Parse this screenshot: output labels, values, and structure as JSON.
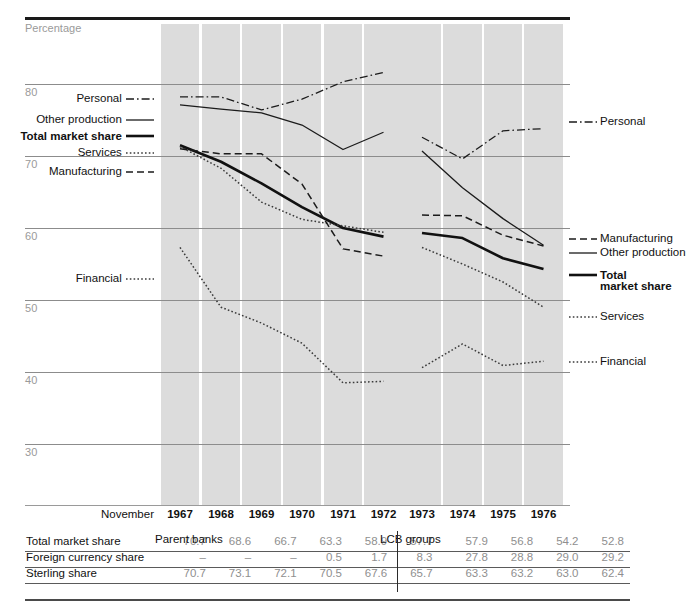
{
  "chart_data": {
    "type": "line",
    "title": "",
    "ylabel": "Percentage",
    "xlabel": "November",
    "ylim": [
      28,
      84
    ],
    "yticks": [
      80,
      70,
      60,
      50,
      40,
      30
    ],
    "grid": true,
    "legend_position": "left-and-right-inline",
    "panels": [
      {
        "name": "Parent banks",
        "x": [
          "1967",
          "1968",
          "1969",
          "1970",
          "1971",
          "1972"
        ],
        "series": [
          {
            "name": "Personal",
            "style": "dash-dot",
            "values": [
              78.2,
              78.2,
              76.4,
              77.9,
              80.3,
              81.6
            ]
          },
          {
            "name": "Other production",
            "style": "solid",
            "values": [
              77.1,
              76.5,
              76.0,
              74.3,
              70.9,
              73.3
            ]
          },
          {
            "name": "Total market share",
            "style": "solid-bold",
            "values": [
              71.5,
              69.2,
              66.2,
              62.9,
              60.0,
              58.8
            ]
          },
          {
            "name": "Services",
            "style": "dotted",
            "values": [
              71.3,
              68.3,
              63.6,
              61.2,
              60.3,
              59.4
            ]
          },
          {
            "name": "Manufacturing",
            "style": "dashed",
            "values": [
              71.0,
              70.3,
              70.3,
              66.1,
              57.1,
              56.1
            ]
          },
          {
            "name": "Financial",
            "style": "dotted",
            "values": [
              57.3,
              49.0,
              46.8,
              44.0,
              38.5,
              38.7
            ]
          }
        ]
      },
      {
        "name": "LCB groups",
        "x": [
          "1973",
          "1974",
          "1975",
          "1976"
        ],
        "series": [
          {
            "name": "Personal",
            "style": "dash-dot",
            "values": [
              72.6,
              69.6,
              73.5,
              73.8
            ]
          },
          {
            "name": "Other production",
            "style": "solid",
            "values": [
              70.7,
              65.6,
              61.3,
              57.6
            ]
          },
          {
            "name": "Manufacturing",
            "style": "dashed",
            "values": [
              61.8,
              61.7,
              59.0,
              57.5
            ]
          },
          {
            "name": "Total market share",
            "style": "solid-bold",
            "values": [
              59.3,
              58.6,
              55.8,
              54.3
            ]
          },
          {
            "name": "Services",
            "style": "dotted",
            "values": [
              57.3,
              55.0,
              52.5,
              49.0
            ]
          },
          {
            "name": "Financial",
            "style": "dotted",
            "values": [
              40.6,
              43.9,
              40.9,
              41.5
            ]
          }
        ]
      }
    ],
    "table": {
      "month_label": "November",
      "group_headers": [
        "Parent banks",
        "LCB groups"
      ],
      "columns": [
        "1967",
        "1968",
        "1969",
        "1970",
        "1971",
        "1972",
        "1973",
        "1974",
        "1975",
        "1976"
      ],
      "rows": [
        {
          "label": "Total market share",
          "values": [
            "70.7",
            "68.6",
            "66.7",
            "63.3",
            "58.9",
            "57.7",
            "57.9",
            "56.8",
            "54.2",
            "52.8"
          ]
        },
        {
          "label": "Foreign currency share",
          "values": [
            "–",
            "–",
            "–",
            "0.5",
            "1.7",
            "8.3",
            "27.8",
            "28.8",
            "29.0",
            "29.2"
          ]
        },
        {
          "label": "Sterling share",
          "values": [
            "70.7",
            "73.1",
            "72.1",
            "70.5",
            "67.6",
            "65.7",
            "63.3",
            "63.2",
            "63.0",
            "62.4"
          ]
        }
      ]
    }
  },
  "labels_left": [
    {
      "text": "Personal",
      "style": "dash-dot"
    },
    {
      "text": "Other production",
      "style": "solid"
    },
    {
      "text": "Total market share",
      "style": "solid-bold",
      "bold": true
    },
    {
      "text": "Services",
      "style": "dotted"
    },
    {
      "text": "Manufacturing",
      "style": "dashed"
    },
    {
      "text": "Financial",
      "style": "dotted"
    }
  ],
  "labels_right": [
    {
      "text": "Personal",
      "style": "dash-dot"
    },
    {
      "text": "Manufacturing",
      "style": "dashed"
    },
    {
      "text": "Other production",
      "style": "solid"
    },
    {
      "text": "Total",
      "text2": "market share",
      "style": "solid-bold",
      "bold": true
    },
    {
      "text": "Services",
      "style": "dotted"
    },
    {
      "text": "Financial",
      "style": "dotted"
    }
  ],
  "colors": {
    "ink": "#111111",
    "grid": "#8c8c8c",
    "band": "#dcdcdc",
    "muted": "#9a9a9a",
    "table_num": "#8f8f8f"
  }
}
